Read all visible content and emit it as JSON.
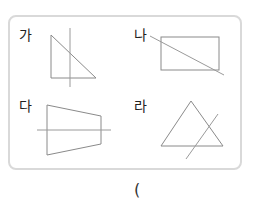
{
  "labels": {
    "ga": "가",
    "na": "나",
    "da": "다",
    "ra": "라"
  },
  "answer": {
    "open_paren": "("
  },
  "colors": {
    "border": "#d9d9d9",
    "shape_stroke": "#8a8a8a",
    "line_stroke": "#9a9a9a"
  }
}
